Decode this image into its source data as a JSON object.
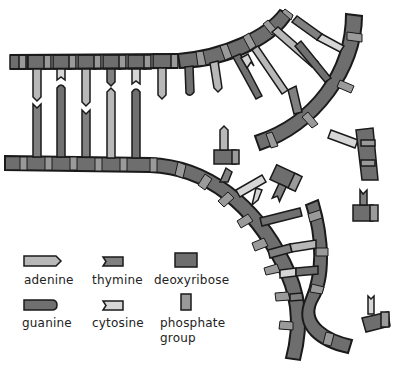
{
  "diagram": {
    "type": "dna-replication",
    "colors": {
      "deoxyribose": "#6e6e6e",
      "phosphate": "#9a9a9a",
      "adenine": "#b8b8b8",
      "thymine": "#808080",
      "guanine": "#707070",
      "cytosine": "#d6d6d6",
      "outline": "#1a1a1a"
    }
  },
  "legend": {
    "items": [
      {
        "key": "adenine",
        "label": "adenine"
      },
      {
        "key": "thymine",
        "label": "thymine"
      },
      {
        "key": "deoxyribose",
        "label": "deoxyribose"
      },
      {
        "key": "guanine",
        "label": "guanine"
      },
      {
        "key": "cytosine",
        "label": "cytosine"
      },
      {
        "key": "phosphate",
        "label_line1": "phosphate",
        "label_line2": "group"
      }
    ]
  }
}
